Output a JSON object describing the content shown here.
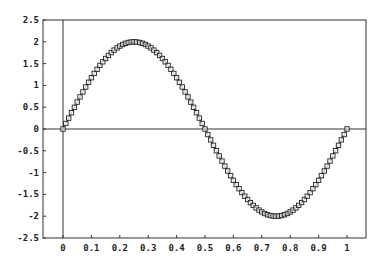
{
  "chart_data": {
    "type": "line",
    "title": "",
    "xlabel": "",
    "ylabel": "",
    "function": "y = 2*sin(2*pi*x)",
    "xlim": [
      0,
      1
    ],
    "ylim": [
      -2.5,
      2.5
    ],
    "grid": false,
    "legend": null,
    "x_ticks": [
      "0",
      "0.1",
      "0.2",
      "0.3",
      "0.4",
      "0.5",
      "0.6",
      "0.7",
      "0.8",
      "0.9",
      "1"
    ],
    "y_ticks": [
      "2.5",
      "2",
      "1.5",
      "1",
      "0.5",
      "0",
      "-0.5",
      "-1",
      "-1.5",
      "-2",
      "-2.5"
    ],
    "reference_lines": [
      {
        "orientation": "horizontal",
        "y": 0
      },
      {
        "orientation": "vertical",
        "x": 0
      }
    ],
    "series": [
      {
        "name": "sine",
        "marker": "square",
        "color": "#222222",
        "num_points": 101,
        "x_start": 0,
        "x_step": 0.01,
        "amplitude": 2,
        "sample_values": [
          {
            "x": 0,
            "y": 0
          },
          {
            "x": 0.25,
            "y": 2
          },
          {
            "x": 0.5,
            "y": 0
          },
          {
            "x": 0.75,
            "y": -2
          },
          {
            "x": 1,
            "y": 0
          }
        ]
      }
    ]
  },
  "colors": {
    "axis": "#333333",
    "line": "#222222",
    "marker_fill": "#ffffff",
    "background": "#ffffff"
  }
}
